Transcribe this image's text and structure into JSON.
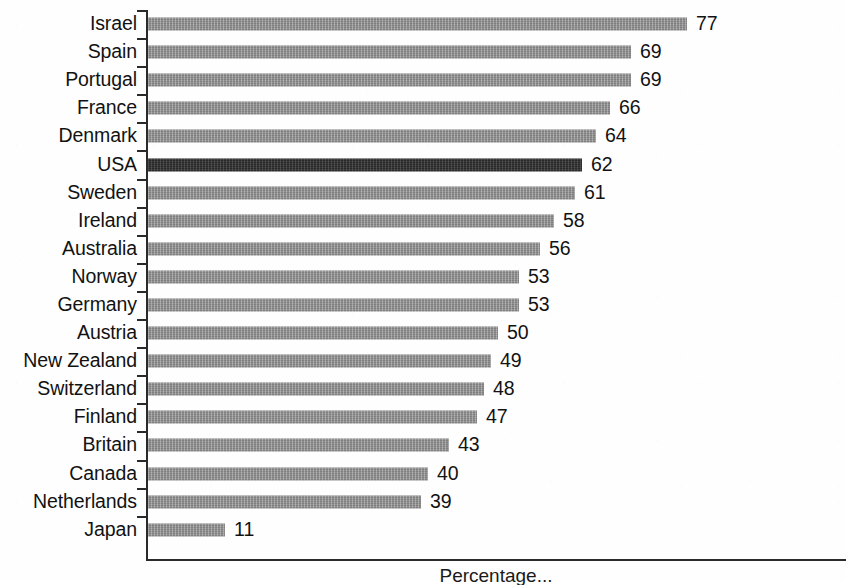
{
  "chart_data": {
    "type": "bar",
    "orientation": "horizontal",
    "title": "",
    "subtitle": "",
    "xlabel": "Percentage...",
    "ylabel": "",
    "xlim": [
      0,
      77
    ],
    "grid": false,
    "legend": null,
    "categories": [
      "Israel",
      "Spain",
      "Portugal",
      "France",
      "Denmark",
      "USA",
      "Sweden",
      "Ireland",
      "Australia",
      "Norway",
      "Germany",
      "Austria",
      "New Zealand",
      "Switzerland",
      "Finland",
      "Britain",
      "Canada",
      "Netherlands",
      "Japan"
    ],
    "values": [
      77,
      69,
      69,
      66,
      64,
      62,
      61,
      58,
      56,
      53,
      53,
      50,
      49,
      48,
      47,
      43,
      40,
      39,
      11
    ],
    "data_labels": [
      "77",
      "69",
      "69",
      "66",
      "64",
      "62",
      "61",
      "58",
      "56",
      "53",
      "53",
      "50",
      "49",
      "48",
      "47",
      "43",
      "40",
      "39",
      "11"
    ],
    "highlighted_category": "USA",
    "highlighted_index": 5,
    "bar_color": "#8f8f8f",
    "highlight_color": "#303030",
    "axis_color": "#2a2a2a",
    "background_color": "#ffffff"
  },
  "axis": {
    "x_caption": "Percentage..."
  }
}
